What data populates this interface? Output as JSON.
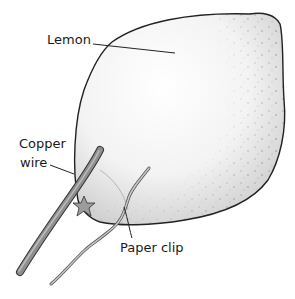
{
  "diagram": {
    "labels": {
      "lemon": "Lemon",
      "copper_line1": "Copper",
      "copper_line2": "wire",
      "paper_clip": "Paper clip"
    },
    "colors": {
      "outline": "#222222",
      "lemon_fill": "#f4f4f4",
      "speckle": "#9a9a9a",
      "wire": "#8a8a8a",
      "wire_dark": "#444444",
      "clip": "#b0b0b0",
      "text": "#1a1a1a"
    }
  }
}
